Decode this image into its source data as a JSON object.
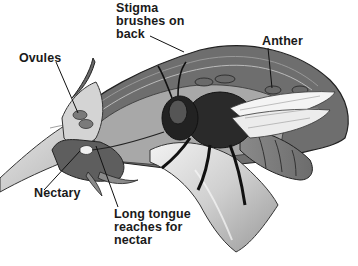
{
  "diagram": {
    "labels": [
      {
        "id": "stigma",
        "text": "Stigma\nbrushes on\nback"
      },
      {
        "id": "anther",
        "text": "Anther"
      },
      {
        "id": "ovules",
        "text": "Ovules"
      },
      {
        "id": "nectary",
        "text": "Nectary"
      },
      {
        "id": "tongue",
        "text": "Long tongue\nreaches for\nnectar"
      }
    ]
  }
}
